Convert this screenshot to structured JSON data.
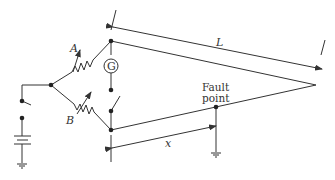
{
  "diagram": {
    "labels": {
      "resistor_a": "A",
      "resistor_b": "B",
      "galvanometer": "G",
      "length": "L",
      "distance": "x",
      "fault_line1": "Fault",
      "fault_line2": "point"
    },
    "colors": {
      "stroke": "#333333",
      "background": "#ffffff"
    }
  }
}
